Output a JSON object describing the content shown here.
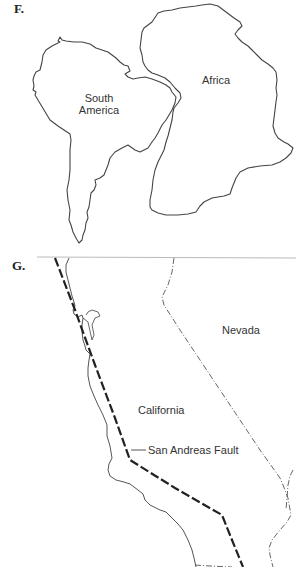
{
  "panels": {
    "f": {
      "label": "F.",
      "south_america_label_line1": "South",
      "south_america_label_line2": "America",
      "africa_label": "Africa"
    },
    "g": {
      "label": "G.",
      "nevada_label": "Nevada",
      "california_label": "California",
      "fault_label": "San Andreas Fault"
    }
  },
  "colors": {
    "outline": "#444444",
    "fault_line": "#222222",
    "border_line": "#555555",
    "divider": "#bbbbbb",
    "background": "#ffffff"
  }
}
